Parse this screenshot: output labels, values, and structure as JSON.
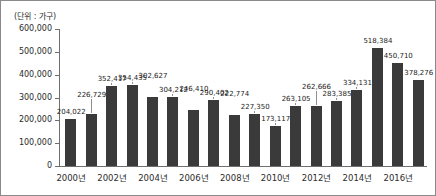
{
  "unit_caption": "(단위 : 가구)",
  "axis": {
    "y_ticks": [
      "600,000",
      "500,000",
      "400,000",
      "300,000",
      "200,000",
      "100,000",
      "0"
    ],
    "x_ticks": [
      "2000년",
      "2002년",
      "2004년",
      "2006년",
      "2008년",
      "2010년",
      "2012년",
      "2014년",
      "2016년"
    ]
  },
  "colors": {
    "bar": "#3a3a3a",
    "axis": "#6f6f6f",
    "text": "#2b2b2b",
    "border": "#8a8a8a",
    "background": "#ffffff"
  },
  "chart_data": {
    "type": "bar",
    "title": "",
    "subtitle": "",
    "xlabel": "",
    "ylabel": "",
    "unit": "(단위 : 가구)",
    "ylim": [
      0,
      600000
    ],
    "ytick_step": 100000,
    "grid": false,
    "legend": null,
    "categories": [
      "2000년",
      "2001년",
      "2002년",
      "2003년",
      "2004년",
      "2005년",
      "2006년",
      "2007년",
      "2008년",
      "2009년",
      "2010년",
      "2011년",
      "2012년",
      "2013년",
      "2014년",
      "2015년",
      "2016년",
      "2017년"
    ],
    "values": [
      204022,
      226729,
      352417,
      354435,
      302627,
      304212,
      246410,
      290402,
      222774,
      227350,
      173117,
      263105,
      262666,
      283385,
      334131,
      518384,
      450710,
      378276
    ],
    "data_labels": [
      "204,022",
      "226,729",
      "352,417",
      "354,435",
      "302,627",
      "304,212",
      "246,410",
      "290,402",
      "222,774",
      "227,350",
      "173,117",
      "263,105",
      "262,666",
      "283,385",
      "334,131",
      "518,384",
      "450,710",
      "378,276"
    ],
    "labeled_x_ticks": [
      "2000년",
      "2002년",
      "2004년",
      "2006년",
      "2008년",
      "2010년",
      "2012년",
      "2014년",
      "2016년"
    ]
  }
}
